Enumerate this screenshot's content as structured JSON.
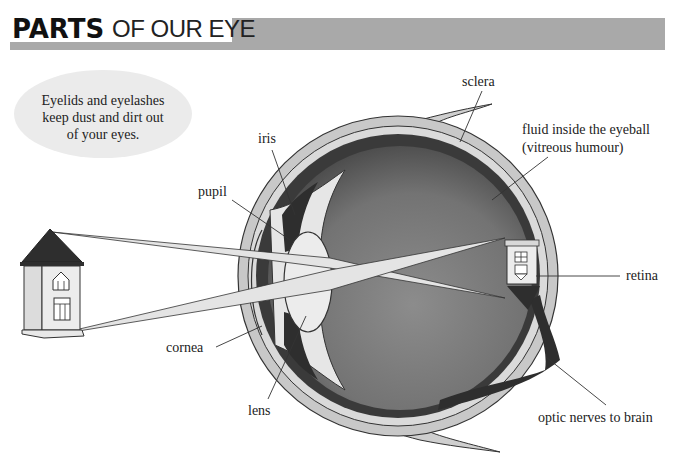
{
  "title": {
    "bold": "PARTS",
    "light": "OF OUR EYE"
  },
  "note": {
    "lines": [
      "Eyelids and eyelashes",
      "keep dust and dirt out",
      "of your eyes."
    ]
  },
  "labels": {
    "sclera": "sclera",
    "fluid_line1": "fluid inside the eyeball",
    "fluid_line2": "(vitreous humour)",
    "iris": "iris",
    "pupil": "pupil",
    "retina": "retina",
    "cornea": "cornea",
    "lens": "lens",
    "optic_nerve": "optic nerves to brain"
  },
  "colors": {
    "header_band": "#a9a9a9",
    "bubble": "#ebebeb",
    "sclera": "#c8c8c8",
    "choroid": "#3a3a3a",
    "vitreous_dark": "#555555",
    "vitreous_light": "#8a8a8a",
    "light_rays": "#e4e4e4",
    "ink": "#222222"
  }
}
